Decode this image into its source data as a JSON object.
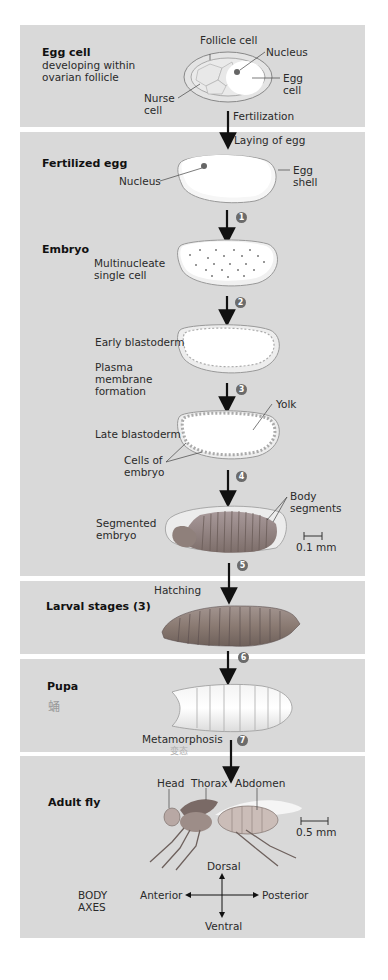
{
  "stages": {
    "egg_cell": {
      "title": "Egg cell",
      "subtitle_line1": "developing within",
      "subtitle_line2": "ovarian follicle",
      "labels": {
        "follicle_cell": "Follicle cell",
        "nucleus": "Nucleus",
        "egg_cell_l1": "Egg",
        "egg_cell_l2": "cell",
        "nurse_cell_l1": "Nurse",
        "nurse_cell_l2": "cell"
      },
      "transition": "Fertilization"
    },
    "fertilized_egg": {
      "title": "Fertilized egg",
      "transition_in": "Laying of egg",
      "labels": {
        "nucleus": "Nucleus",
        "egg_shell_l1": "Egg",
        "egg_shell_l2": "shell"
      }
    },
    "embryo": {
      "title": "Embryo",
      "multinucleate_l1": "Multinucleate",
      "multinucleate_l2": "single cell",
      "early_blastoderm": "Early blastoderm",
      "plasma_l1": "Plasma",
      "plasma_l2": "membrane",
      "plasma_l3": "formation",
      "yolk": "Yolk",
      "late_blastoderm": "Late blastoderm",
      "cells_l1": "Cells of",
      "cells_l2": "embryo",
      "body_segments_l1": "Body",
      "body_segments_l2": "segments",
      "segmented_l1": "Segmented",
      "segmented_l2": "embryo",
      "scale": "0.1 mm"
    },
    "larval": {
      "title": "Larval stages (3)",
      "transition_in": "Hatching"
    },
    "pupa": {
      "title": "Pupa",
      "handwritten_note": "蛹",
      "transition_out": "Metamorphosis",
      "handwritten_note2": "变态"
    },
    "adult": {
      "title": "Adult fly",
      "head": "Head",
      "thorax": "Thorax",
      "abdomen": "Abdomen",
      "scale": "0.5 mm",
      "axes": {
        "label_l1": "BODY",
        "label_l2": "AXES",
        "dorsal": "Dorsal",
        "ventral": "Ventral",
        "anterior": "Anterior",
        "posterior": "Posterior"
      }
    }
  },
  "steps": [
    "1",
    "2",
    "3",
    "4",
    "5",
    "6",
    "7"
  ],
  "colors": {
    "panel_bg": "#d9d9d9",
    "badge": "#6b6b6b",
    "larva": "#8a7a72",
    "embryo_segments": "#9b8a84"
  }
}
